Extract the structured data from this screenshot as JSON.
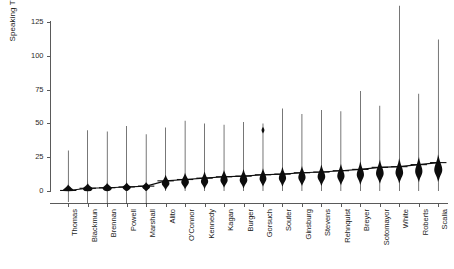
{
  "chart_data": {
    "type": "violin",
    "title": "",
    "xlabel": "",
    "ylabel": "Speaking Turns",
    "ylim": [
      0,
      137
    ],
    "yticks": [
      0,
      25,
      50,
      75,
      100,
      125
    ],
    "grid": false,
    "legend": "none",
    "orientation": "vertical",
    "sorted_by": "median ascending",
    "categories": [
      "Thomas",
      "Blackmun",
      "Brennan",
      "Powell",
      "Marshall",
      "Alito",
      "O'Connor",
      "Kennedy",
      "Kagan",
      "Burger",
      "Gorsuch",
      "Souter",
      "Ginsburg",
      "Stevens",
      "Rehnquist",
      "Breyer",
      "Sotomayor",
      "White",
      "Roberts",
      "Scalia"
    ],
    "series": [
      {
        "name": "Speaking Turns distribution",
        "violins": [
          {
            "category": "Thomas",
            "median": 0.4,
            "max": 30,
            "width": 5.4,
            "peak": 0.4,
            "spread": 2.6,
            "symmetric": true
          },
          {
            "category": "Blackmun",
            "median": 2.0,
            "max": 45,
            "width": 4.8,
            "peak": 1.6,
            "spread": 2.4,
            "symmetric": true
          },
          {
            "category": "Brennan",
            "median": 2.4,
            "max": 44,
            "width": 4.6,
            "peak": 2.0,
            "spread": 2.4,
            "symmetric": true
          },
          {
            "category": "Powell",
            "median": 3.0,
            "max": 48,
            "width": 4.2,
            "peak": 2.6,
            "spread": 2.2,
            "symmetric": true
          },
          {
            "category": "Marshall",
            "median": 3.6,
            "max": 42,
            "width": 4.0,
            "peak": 3.0,
            "spread": 2.2,
            "symmetric": true
          },
          {
            "category": "Alito",
            "median": 7.5,
            "max": 47,
            "width": 3.8,
            "peak": 5.5,
            "spread": 4.0,
            "symmetric": false
          },
          {
            "category": "O'Connor",
            "median": 8.5,
            "max": 52,
            "width": 3.8,
            "peak": 6.5,
            "spread": 4.4,
            "symmetric": false
          },
          {
            "category": "Kennedy",
            "median": 9.5,
            "max": 50,
            "width": 3.6,
            "peak": 7.0,
            "spread": 4.6,
            "symmetric": false
          },
          {
            "category": "Kagan",
            "median": 10.5,
            "max": 49,
            "width": 3.6,
            "peak": 8.0,
            "spread": 4.8,
            "symmetric": false
          },
          {
            "category": "Burger",
            "median": 11.0,
            "max": 51,
            "width": 3.8,
            "peak": 8.0,
            "spread": 5.0,
            "symmetric": false
          },
          {
            "category": "Gorsuch",
            "median": 12.0,
            "max": 50,
            "width": 3.4,
            "peak": 9.0,
            "spread": 5.0,
            "symmetric": false,
            "secondary_peak": 45,
            "secondary_width": 2.0
          },
          {
            "category": "Souter",
            "median": 12.5,
            "max": 61,
            "width": 3.6,
            "peak": 9.5,
            "spread": 5.2,
            "symmetric": false
          },
          {
            "category": "Ginsburg",
            "median": 13.5,
            "max": 57,
            "width": 3.6,
            "peak": 10.0,
            "spread": 5.4,
            "symmetric": false
          },
          {
            "category": "Stevens",
            "median": 14.0,
            "max": 60,
            "width": 3.8,
            "peak": 10.5,
            "spread": 5.6,
            "symmetric": false
          },
          {
            "category": "Rehnquist",
            "median": 15.0,
            "max": 59,
            "width": 3.6,
            "peak": 11.0,
            "spread": 5.8,
            "symmetric": false
          },
          {
            "category": "Breyer",
            "median": 16.0,
            "max": 74,
            "width": 3.6,
            "peak": 12.0,
            "spread": 6.2,
            "symmetric": false
          },
          {
            "category": "Sotomayor",
            "median": 17.5,
            "max": 63,
            "width": 3.8,
            "peak": 13.0,
            "spread": 6.4,
            "symmetric": false
          },
          {
            "category": "White",
            "median": 18.0,
            "max": 137,
            "width": 3.8,
            "peak": 13.5,
            "spread": 6.6,
            "symmetric": false
          },
          {
            "category": "Roberts",
            "median": 19.5,
            "max": 72,
            "width": 3.6,
            "peak": 14.5,
            "spread": 6.8,
            "symmetric": false
          },
          {
            "category": "Scalia",
            "median": 21.0,
            "max": 112,
            "width": 4.0,
            "peak": 15.5,
            "spread": 7.2,
            "symmetric": false
          }
        ]
      }
    ]
  },
  "axes": {
    "y_label": "Speaking Turns",
    "y_tick_labels": [
      "125",
      "100",
      "75",
      "50",
      "25",
      "0"
    ]
  }
}
